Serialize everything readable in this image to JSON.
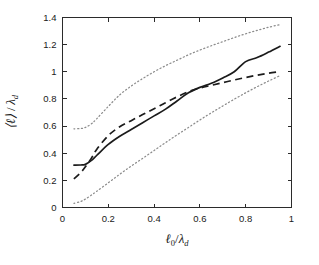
{
  "figure": {
    "background_color": "#ffffff",
    "axis_color": "#2b2b2b",
    "solid_color": "#1b1b1b",
    "dotted_color": "#8c8c8c"
  },
  "axes": {
    "x_label_main": "ℓ",
    "x_label_sub": "0",
    "x_label_denom": "λ",
    "x_label_denom_sub": "d",
    "y_label_main": "⟨ℓ⟩",
    "y_label_denom": "λ",
    "y_label_denom_sub": "d",
    "x_ticks": [
      "0",
      "0.2",
      "0.4",
      "0.6",
      "0.8",
      "1"
    ],
    "y_ticks": [
      "0",
      "0.2",
      "0.4",
      "0.6",
      "0.8",
      "1",
      "1.2",
      "1.4"
    ]
  },
  "chart_data": {
    "type": "line",
    "title": "",
    "xlabel": "ℓ₀/λ_d",
    "ylabel": "⟨ℓ⟩/λ_d",
    "xlim": [
      0,
      1
    ],
    "ylim": [
      0,
      1.4
    ],
    "xticks": [
      0,
      0.2,
      0.4,
      0.6,
      0.8,
      1
    ],
    "yticks": [
      0,
      0.2,
      0.4,
      0.6,
      0.8,
      1.0,
      1.2,
      1.4
    ],
    "grid": false,
    "legend": "none",
    "series": [
      {
        "name": "mean",
        "style": "solid",
        "color": "#1b1b1b",
        "x": [
          0.05,
          0.08,
          0.1,
          0.125,
          0.15,
          0.2,
          0.25,
          0.3,
          0.35,
          0.4,
          0.45,
          0.5,
          0.55,
          0.6,
          0.65,
          0.7,
          0.75,
          0.8,
          0.85,
          0.9,
          0.95
        ],
        "y": [
          0.312,
          0.313,
          0.318,
          0.345,
          0.385,
          0.465,
          0.525,
          0.575,
          0.625,
          0.675,
          0.725,
          0.785,
          0.845,
          0.885,
          0.915,
          0.955,
          1.0,
          1.075,
          1.105,
          1.145,
          1.188
        ]
      },
      {
        "name": "model",
        "style": "dashed",
        "color": "#1b1b1b",
        "x": [
          0.05,
          0.08,
          0.1,
          0.125,
          0.15,
          0.2,
          0.25,
          0.3,
          0.35,
          0.4,
          0.45,
          0.5,
          0.55,
          0.6,
          0.65,
          0.7,
          0.75,
          0.8,
          0.85,
          0.9,
          0.95
        ],
        "y": [
          0.21,
          0.258,
          0.3,
          0.36,
          0.43,
          0.53,
          0.595,
          0.64,
          0.685,
          0.728,
          0.772,
          0.815,
          0.853,
          0.88,
          0.9,
          0.92,
          0.94,
          0.958,
          0.975,
          0.99,
          1.002
        ]
      },
      {
        "name": "upper-bound",
        "style": "dotted",
        "color": "#8c8c8c",
        "x": [
          0.05,
          0.08,
          0.1,
          0.125,
          0.15,
          0.2,
          0.25,
          0.3,
          0.35,
          0.4,
          0.45,
          0.5,
          0.55,
          0.6,
          0.65,
          0.7,
          0.75,
          0.8,
          0.85,
          0.9,
          0.95
        ],
        "y": [
          0.58,
          0.582,
          0.59,
          0.615,
          0.655,
          0.745,
          0.83,
          0.895,
          0.95,
          1.0,
          1.045,
          1.085,
          1.125,
          1.16,
          1.192,
          1.222,
          1.252,
          1.28,
          1.305,
          1.328,
          1.348
        ]
      },
      {
        "name": "lower-bound",
        "style": "dotted",
        "color": "#8c8c8c",
        "x": [
          0.05,
          0.08,
          0.1,
          0.125,
          0.15,
          0.2,
          0.25,
          0.3,
          0.35,
          0.4,
          0.45,
          0.5,
          0.55,
          0.6,
          0.65,
          0.7,
          0.75,
          0.8,
          0.85,
          0.9,
          0.95
        ],
        "y": [
          0.03,
          0.045,
          0.062,
          0.09,
          0.12,
          0.182,
          0.245,
          0.305,
          0.362,
          0.42,
          0.478,
          0.535,
          0.59,
          0.645,
          0.698,
          0.748,
          0.798,
          0.845,
          0.89,
          0.932,
          0.972
        ]
      }
    ]
  }
}
